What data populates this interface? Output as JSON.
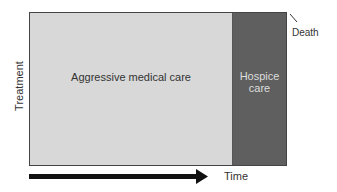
{
  "diagram": {
    "y_axis_label": "Treatment",
    "x_axis_label": "Time",
    "regions": [
      {
        "label": "Aggressive medical care",
        "color": "#d8d8d8"
      },
      {
        "label_line1": "Hospice",
        "label_line2": "care",
        "color": "#5f5f5f"
      }
    ],
    "endpoint_label": "Death"
  }
}
